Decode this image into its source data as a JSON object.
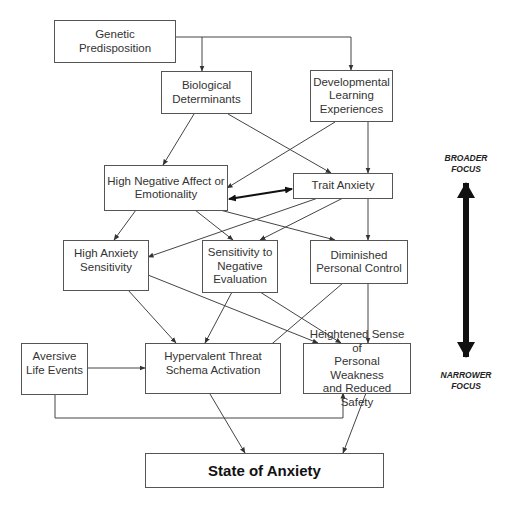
{
  "diagram": {
    "nodes": [
      {
        "id": "genetic",
        "label": "Genetic\nPredisposition"
      },
      {
        "id": "biological",
        "label": "Biological\nDeterminants"
      },
      {
        "id": "developmental",
        "label": "Developmental\nLearning\nExperiences"
      },
      {
        "id": "negative_affect",
        "label": "High Negative Affect or\nEmotionality"
      },
      {
        "id": "trait_anxiety",
        "label": "Trait Anxiety"
      },
      {
        "id": "anxiety_sensitivity",
        "label": "High Anxiety\nSensitivity"
      },
      {
        "id": "neg_evaluation",
        "label": "Sensitivity to\nNegative\nEvaluation"
      },
      {
        "id": "personal_control",
        "label": "Diminished\nPersonal Control"
      },
      {
        "id": "aversive",
        "label": "Aversive\nLife Events"
      },
      {
        "id": "hypervalent",
        "label": "Hypervalent Threat\nSchema Activation"
      },
      {
        "id": "weakness",
        "label": "Heightened Sense of\nPersonal Weakness\nand Reduced Safety"
      },
      {
        "id": "state",
        "label": "State of Anxiety"
      }
    ],
    "edges": [
      {
        "from": "genetic",
        "to": "biological"
      },
      {
        "from": "genetic",
        "to": "developmental"
      },
      {
        "from": "biological",
        "to": "negative_affect"
      },
      {
        "from": "biological",
        "to": "trait_anxiety"
      },
      {
        "from": "developmental",
        "to": "negative_affect"
      },
      {
        "from": "developmental",
        "to": "trait_anxiety"
      },
      {
        "from": "negative_affect",
        "to": "trait_anxiety",
        "bidirectional": true,
        "bold": true
      },
      {
        "from": "negative_affect",
        "to": "anxiety_sensitivity"
      },
      {
        "from": "negative_affect",
        "to": "neg_evaluation"
      },
      {
        "from": "negative_affect",
        "to": "personal_control"
      },
      {
        "from": "trait_anxiety",
        "to": "anxiety_sensitivity"
      },
      {
        "from": "trait_anxiety",
        "to": "neg_evaluation"
      },
      {
        "from": "trait_anxiety",
        "to": "personal_control"
      },
      {
        "from": "anxiety_sensitivity",
        "to": "hypervalent"
      },
      {
        "from": "anxiety_sensitivity",
        "to": "weakness"
      },
      {
        "from": "neg_evaluation",
        "to": "hypervalent"
      },
      {
        "from": "neg_evaluation",
        "to": "weakness"
      },
      {
        "from": "personal_control",
        "to": "hypervalent"
      },
      {
        "from": "personal_control",
        "to": "weakness"
      },
      {
        "from": "aversive",
        "to": "hypervalent"
      },
      {
        "from": "aversive",
        "to": "weakness"
      },
      {
        "from": "hypervalent",
        "to": "state"
      },
      {
        "from": "weakness",
        "to": "state"
      }
    ],
    "focus_scale": {
      "top_label": "BROADER\nFOCUS",
      "bottom_label": "NARROWER\nFOCUS"
    }
  }
}
